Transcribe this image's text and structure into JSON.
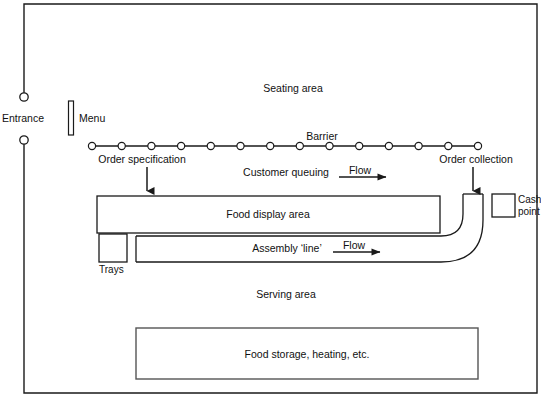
{
  "diagram": {
    "type": "process-layout-diagram",
    "colors": {
      "stroke": "#1a1a1a",
      "background": "#ffffff",
      "text": "#111111"
    },
    "outer_boundary": {
      "name": "restaurant-outline",
      "x": 24,
      "y": 4,
      "width": 513,
      "height": 389,
      "left_wall_gap": {
        "from_y": 97,
        "to_y": 140
      }
    },
    "labels": {
      "entrance": "Entrance",
      "menu": "Menu",
      "seating_area": "Seating area",
      "barrier": "Barrier",
      "order_specification": "Order specification",
      "order_collection": "Order collection",
      "customer_queuing": "Customer queuing",
      "flow_upper": "Flow",
      "flow_lower": "Flow",
      "food_display_area": "Food display area",
      "assembly_line": "Assembly ‘line’",
      "trays": "Trays",
      "cash_point_line1": "Cash",
      "cash_point_line2": "point",
      "serving_area": "Serving area",
      "food_storage": "Food storage, heating, etc."
    },
    "barrier_line": {
      "name": "barrier-queue-line",
      "y": 146,
      "x_start": 92,
      "x_end": 478,
      "post_count": 14,
      "post_radius": 3.6
    },
    "boxes": [
      {
        "name": "food-display-area",
        "x": 97,
        "y": 196,
        "width": 343,
        "height": 37
      },
      {
        "name": "trays",
        "x": 99,
        "y": 234,
        "width": 28,
        "height": 28
      },
      {
        "name": "cash-point",
        "x": 492,
        "y": 194,
        "width": 23,
        "height": 23
      },
      {
        "name": "food-storage",
        "x": 136,
        "y": 328,
        "width": 342,
        "height": 51
      }
    ],
    "assembly_tube": {
      "name": "assembly-line-tube",
      "inner_left": 136,
      "inner_top": 236,
      "inner_right_straight": 455,
      "outer_bottom": 262,
      "curve_top_y": 194,
      "tube_right_x": 483
    },
    "arrows": [
      {
        "name": "order-specification-arrow",
        "direction": "down",
        "x": 147,
        "y1": 167,
        "y2": 191
      },
      {
        "name": "order-collection-arrow",
        "direction": "down",
        "x": 473,
        "y1": 167,
        "y2": 191
      },
      {
        "name": "flow-arrow-upper",
        "direction": "right",
        "y": 177,
        "x1": 339,
        "x2": 391
      },
      {
        "name": "flow-arrow-lower",
        "direction": "right",
        "y": 252,
        "x1": 333,
        "x2": 385
      }
    ]
  }
}
